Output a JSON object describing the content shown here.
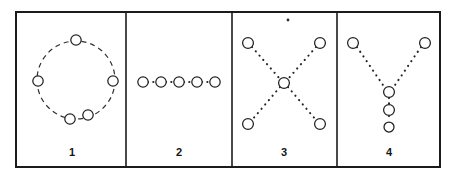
{
  "figure": {
    "title": "",
    "background_color": "#ffffff",
    "ink_color": "#1b1b1b",
    "width": 457,
    "height": 180,
    "frame": {
      "x": 16,
      "y": 12,
      "width": 424,
      "height": 155,
      "stroke_width": 2
    },
    "panel_dividers_x": [
      126,
      232,
      337
    ],
    "panels": [
      {
        "id": "panel-1",
        "label": "1",
        "label_x": 72,
        "label_y": 152,
        "topology": "ring",
        "description": "five open circles spaced around a dashed circular path",
        "node_count": 5,
        "link_style": "dashed-arc",
        "ring": {
          "cx": 76,
          "cy": 80,
          "r": 39
        },
        "nodes": [
          {
            "name": "node-top",
            "cx": 76,
            "cy": 40,
            "r": 5.2
          },
          {
            "name": "node-left",
            "cx": 38,
            "cy": 81,
            "r": 5.2
          },
          {
            "name": "node-right",
            "cx": 113,
            "cy": 81,
            "r": 5.2
          },
          {
            "name": "node-bottom-left",
            "cx": 70,
            "cy": 119,
            "r": 5.2
          },
          {
            "name": "node-bottom-right",
            "cx": 88,
            "cy": 115,
            "r": 5.2
          }
        ]
      },
      {
        "id": "panel-2",
        "label": "2",
        "label_x": 179,
        "label_y": 152,
        "topology": "linear-bus",
        "description": "five open circles in a horizontal row joined by dotted segments",
        "node_count": 5,
        "link_style": "dotted-line",
        "nodes": [
          {
            "name": "node-1",
            "cx": 143,
            "cy": 82,
            "r": 5.2
          },
          {
            "name": "node-2",
            "cx": 161,
            "cy": 82,
            "r": 5.2
          },
          {
            "name": "node-3",
            "cx": 179,
            "cy": 82,
            "r": 5.2
          },
          {
            "name": "node-4",
            "cx": 197,
            "cy": 82,
            "r": 5.2
          },
          {
            "name": "node-5",
            "cx": 215,
            "cy": 82,
            "r": 5.2
          }
        ],
        "links": [
          {
            "x1": 148,
            "y1": 82,
            "x2": 156,
            "y2": 82
          },
          {
            "x1": 166,
            "y1": 82,
            "x2": 174,
            "y2": 82
          },
          {
            "x1": 184,
            "y1": 82,
            "x2": 192,
            "y2": 82
          },
          {
            "x1": 202,
            "y1": 82,
            "x2": 210,
            "y2": 82
          }
        ]
      },
      {
        "id": "panel-3",
        "label": "3",
        "label_x": 284,
        "label_y": 152,
        "topology": "cross-star",
        "description": "four corner circles connected by dotted diagonals through one central circle forming an X",
        "node_count": 5,
        "link_style": "dotted-diagonal",
        "nodes": [
          {
            "name": "node-top-left",
            "cx": 248,
            "cy": 43,
            "r": 5.4
          },
          {
            "name": "node-top-right",
            "cx": 320,
            "cy": 43,
            "r": 5.4
          },
          {
            "name": "node-center",
            "cx": 284,
            "cy": 83,
            "r": 5.4
          },
          {
            "name": "node-bottom-left",
            "cx": 248,
            "cy": 124,
            "r": 5.4
          },
          {
            "name": "node-bottom-right",
            "cx": 320,
            "cy": 124,
            "r": 5.4
          }
        ],
        "links": [
          {
            "x1": 252,
            "y1": 47,
            "x2": 280,
            "y2": 79
          },
          {
            "x1": 316,
            "y1": 47,
            "x2": 288,
            "y2": 79
          },
          {
            "x1": 280,
            "y1": 87,
            "x2": 252,
            "y2": 120
          },
          {
            "x1": 288,
            "y1": 87,
            "x2": 316,
            "y2": 120
          }
        ],
        "artifact_speck": {
          "cx": 288,
          "cy": 20,
          "r": 1.4
        }
      },
      {
        "id": "panel-4",
        "label": "4",
        "label_x": 389,
        "label_y": 152,
        "topology": "y-junction",
        "description": "two upper circles joined by dotted diagonals to a junction circle with two more circles below it",
        "node_count": 5,
        "link_style": "dotted-diagonal-and-vertical",
        "nodes": [
          {
            "name": "node-branch-left",
            "cx": 353,
            "cy": 43,
            "r": 5.4
          },
          {
            "name": "node-branch-right",
            "cx": 425,
            "cy": 43,
            "r": 5.4
          },
          {
            "name": "node-junction",
            "cx": 389,
            "cy": 92,
            "r": 5.4
          },
          {
            "name": "node-stem-middle",
            "cx": 389,
            "cy": 110,
            "r": 5.4
          },
          {
            "name": "node-stem-bottom",
            "cx": 389,
            "cy": 127,
            "r": 5.0
          }
        ],
        "links": [
          {
            "x1": 357,
            "y1": 47,
            "x2": 385,
            "y2": 88
          },
          {
            "x1": 421,
            "y1": 47,
            "x2": 393,
            "y2": 88
          },
          {
            "x1": 389,
            "y1": 97,
            "x2": 389,
            "y2": 105
          },
          {
            "x1": 389,
            "y1": 115,
            "x2": 389,
            "y2": 122
          }
        ]
      }
    ]
  }
}
